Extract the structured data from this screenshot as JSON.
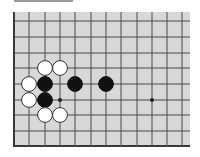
{
  "diagram": {
    "type": "go-board-fragment",
    "board_color": "#d8d8d8",
    "line_color": "#4a4a4a",
    "edge_color": "#3a3a3a",
    "edges_shown": [
      "left",
      "bottom"
    ],
    "columns": 12,
    "rows": 9,
    "star_points": [
      {
        "col": 3,
        "row": 5
      },
      {
        "col": 9,
        "row": 5
      }
    ],
    "stones": [
      {
        "color": "white",
        "col": 2,
        "row": 3
      },
      {
        "color": "white",
        "col": 3,
        "row": 3
      },
      {
        "color": "white",
        "col": 1,
        "row": 4
      },
      {
        "color": "black",
        "col": 2,
        "row": 4
      },
      {
        "color": "black",
        "col": 4,
        "row": 4
      },
      {
        "color": "black",
        "col": 6,
        "row": 4
      },
      {
        "color": "white",
        "col": 1,
        "row": 5
      },
      {
        "color": "black",
        "col": 2,
        "row": 5
      },
      {
        "color": "white",
        "col": 2,
        "row": 6
      },
      {
        "color": "white",
        "col": 3,
        "row": 6
      }
    ]
  }
}
